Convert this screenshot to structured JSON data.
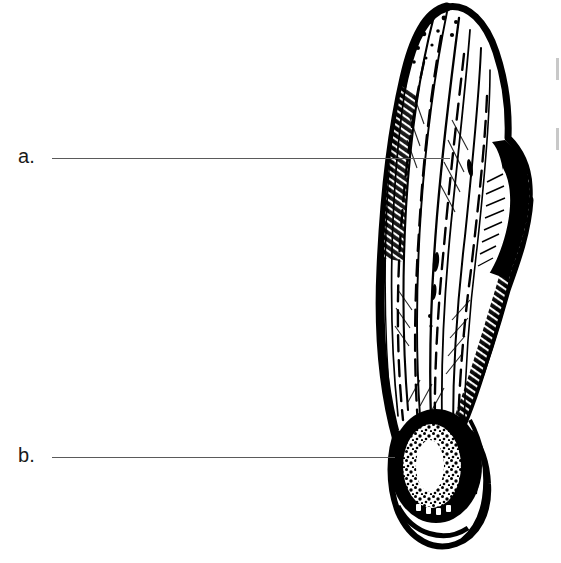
{
  "figure": {
    "name": "samara-winged-seed",
    "ink_color": "#000000",
    "background_color": "#ffffff",
    "line_color": "#5a5a5a"
  },
  "labels": [
    {
      "id": "a",
      "text": "a.",
      "target": "wing",
      "text_x": 18,
      "text_y": 146,
      "line_x": 52,
      "line_y": 158,
      "line_width": 398
    },
    {
      "id": "b",
      "text": "b.",
      "target": "seed-body",
      "text_x": 18,
      "text_y": 445,
      "line_x": 52,
      "line_y": 457,
      "line_width": 343
    }
  ],
  "edge_artifacts": [
    {
      "x": 556,
      "y": 58,
      "height": 22
    },
    {
      "x": 556,
      "y": 128,
      "height": 22
    }
  ]
}
